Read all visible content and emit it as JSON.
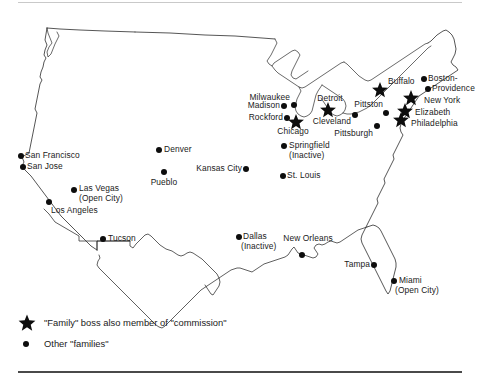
{
  "figure": {
    "top_rule": true,
    "bottom_rule": true
  },
  "legend": {
    "items": [
      {
        "symbol": "star-icon",
        "label": "\"Family\" boss also member of \"commission\""
      },
      {
        "symbol": "dot-icon",
        "label": "Other \"families\""
      }
    ]
  },
  "cities": [
    {
      "name": "San Francisco",
      "label": "San Francisco",
      "marker": "dot",
      "mx": 21,
      "my": 156,
      "lx": 25,
      "ly": 156,
      "align": "right"
    },
    {
      "name": "San Jose",
      "label": "San Jose",
      "marker": "dot",
      "mx": 23,
      "my": 167,
      "lx": 27,
      "ly": 167,
      "align": "right"
    },
    {
      "name": "Las Vegas",
      "label": "Las Vegas",
      "marker": "dot",
      "mx": 74,
      "my": 190,
      "lx": 79,
      "ly": 189,
      "align": "right"
    },
    {
      "name": "Las Vegas Open City",
      "label": "(Open City)",
      "marker": "none",
      "mx": 0,
      "my": 0,
      "lx": 79,
      "ly": 199,
      "align": "right"
    },
    {
      "name": "Los Angeles",
      "label": "Los Angeles",
      "marker": "dot",
      "mx": 49,
      "my": 202,
      "lx": 51,
      "ly": 211,
      "align": "right"
    },
    {
      "name": "Tucson",
      "label": "Tucson",
      "marker": "dot",
      "mx": 103,
      "my": 239,
      "lx": 108,
      "ly": 239,
      "align": "right"
    },
    {
      "name": "Denver",
      "label": "Denver",
      "marker": "dot",
      "mx": 159,
      "my": 150,
      "lx": 164,
      "ly": 150,
      "align": "right"
    },
    {
      "name": "Pueblo",
      "label": "Pueblo",
      "marker": "dot",
      "mx": 164,
      "my": 172,
      "lx": 164,
      "ly": 183,
      "align": "center"
    },
    {
      "name": "Kansas City",
      "label": "Kansas City",
      "marker": "dot",
      "mx": 246,
      "my": 169,
      "lx": 242,
      "ly": 169,
      "align": "left"
    },
    {
      "name": "Milwaukee",
      "label": "Milwaukee",
      "marker": "dot",
      "mx": 294,
      "my": 105,
      "lx": 290,
      "ly": 98,
      "align": "left"
    },
    {
      "name": "Madison",
      "label": "Madison",
      "marker": "dot",
      "mx": 284,
      "my": 106,
      "lx": 280,
      "ly": 106,
      "align": "left"
    },
    {
      "name": "Rockford",
      "label": "Rockford",
      "marker": "dot",
      "mx": 287,
      "my": 118,
      "lx": 283,
      "ly": 118,
      "align": "left"
    },
    {
      "name": "Chicago",
      "label": "Chicago",
      "marker": "star",
      "mx": 296,
      "my": 122,
      "lx": 293,
      "ly": 132,
      "align": "center"
    },
    {
      "name": "Detroit",
      "label": "Detroit",
      "marker": "star",
      "mx": 328,
      "my": 110,
      "lx": 330,
      "ly": 99,
      "align": "center"
    },
    {
      "name": "Cleveland",
      "label": "Cleveland",
      "marker": "dot",
      "mx": 355,
      "my": 115,
      "lx": 351,
      "ly": 122,
      "align": "left"
    },
    {
      "name": "Pittston",
      "label": "Pittston",
      "marker": "dot",
      "mx": 386,
      "my": 113,
      "lx": 383,
      "ly": 105,
      "align": "left"
    },
    {
      "name": "Pittsburgh",
      "label": "Pittsburgh",
      "marker": "dot",
      "mx": 377,
      "my": 126,
      "lx": 373,
      "ly": 134,
      "align": "left"
    },
    {
      "name": "Buffalo",
      "label": "Buffalo",
      "marker": "star",
      "mx": 380,
      "my": 90,
      "lx": 388,
      "ly": 82,
      "align": "right"
    },
    {
      "name": "Boston",
      "label": "Boston-",
      "marker": "dot",
      "mx": 424,
      "my": 79,
      "lx": 428,
      "ly": 79,
      "align": "right"
    },
    {
      "name": "Providence",
      "label": "Providence",
      "marker": "dot",
      "mx": 428,
      "my": 89,
      "lx": 432,
      "ly": 89,
      "align": "right"
    },
    {
      "name": "New York",
      "label": "New York",
      "marker": "star",
      "mx": 411,
      "my": 98,
      "lx": 424,
      "ly": 101,
      "align": "right"
    },
    {
      "name": "Elizabeth",
      "label": "Elizabeth",
      "marker": "star",
      "mx": 405,
      "my": 111,
      "lx": 415,
      "ly": 113,
      "align": "right"
    },
    {
      "name": "Philadelphia",
      "label": "Philadelphia",
      "marker": "star",
      "mx": 401,
      "my": 120,
      "lx": 411,
      "ly": 124,
      "align": "right"
    },
    {
      "name": "Springfield",
      "label": "Springfield",
      "marker": "dot",
      "mx": 284,
      "my": 146,
      "lx": 289,
      "ly": 146,
      "align": "right"
    },
    {
      "name": "Springfield Inactive",
      "label": "(Inactive)",
      "marker": "none",
      "mx": 0,
      "my": 0,
      "lx": 289,
      "ly": 156,
      "align": "right"
    },
    {
      "name": "St. Louis",
      "label": "St. Louis",
      "marker": "dot",
      "mx": 283,
      "my": 176,
      "lx": 287,
      "ly": 176,
      "align": "right"
    },
    {
      "name": "Dallas",
      "label": "Dallas",
      "marker": "dot",
      "mx": 239,
      "my": 237,
      "lx": 243,
      "ly": 237,
      "align": "right"
    },
    {
      "name": "Dallas Inactive",
      "label": "(Inactive)",
      "marker": "none",
      "mx": 0,
      "my": 0,
      "lx": 241,
      "ly": 247,
      "align": "right"
    },
    {
      "name": "New Orleans",
      "label": "New Orleans",
      "marker": "dot",
      "mx": 302,
      "my": 255,
      "lx": 308,
      "ly": 239,
      "align": "center"
    },
    {
      "name": "Tampa",
      "label": "Tampa",
      "marker": "dot",
      "mx": 374,
      "my": 265,
      "lx": 370,
      "ly": 265,
      "align": "left"
    },
    {
      "name": "Miami",
      "label": "Miami",
      "marker": "dot",
      "mx": 394,
      "my": 281,
      "lx": 399,
      "ly": 281,
      "align": "right"
    },
    {
      "name": "Miami Open City",
      "label": "(Open City)",
      "marker": "none",
      "mx": 0,
      "my": 0,
      "lx": 395,
      "ly": 291,
      "align": "right"
    }
  ]
}
